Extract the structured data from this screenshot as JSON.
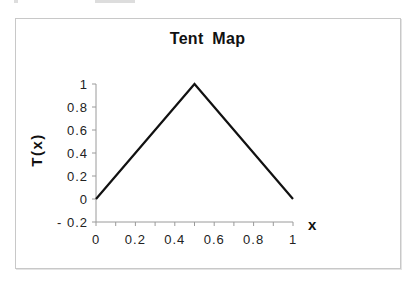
{
  "chart_data": {
    "type": "line",
    "title": "Tent Map",
    "xlabel": "x",
    "ylabel": "T(x)",
    "x": [
      0,
      0.5,
      1
    ],
    "series": [
      {
        "name": "T(x)",
        "values": [
          0,
          1,
          0
        ],
        "color": "#111111"
      }
    ],
    "xlim": [
      0,
      1
    ],
    "ylim": [
      -0.2,
      1
    ],
    "x_ticks": [
      "0",
      "0.2",
      "0.4",
      "0.6",
      "0.8",
      "1"
    ],
    "y_ticks": [
      "1",
      "0.8",
      "0.6",
      "0.4",
      "0.2",
      "0",
      "-0.2"
    ],
    "x_minor_step": 0.1,
    "grid": false,
    "legend": "none"
  }
}
